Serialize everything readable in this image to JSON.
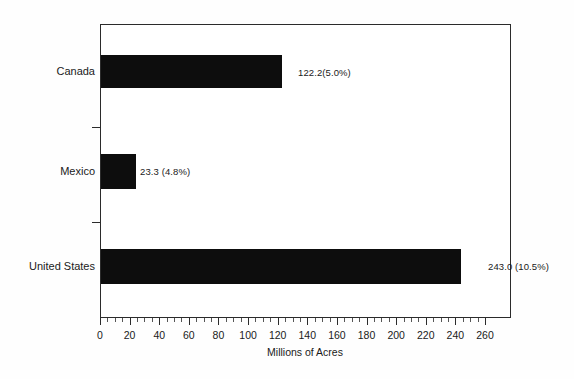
{
  "chart_data": {
    "type": "bar",
    "orientation": "horizontal",
    "title": "",
    "xlabel": "Millions of Acres",
    "ylabel": "",
    "xlim": [
      0,
      260
    ],
    "xticks": [
      0,
      20,
      40,
      60,
      80,
      100,
      120,
      140,
      160,
      180,
      200,
      220,
      240,
      260
    ],
    "xtick_labels": [
      "0",
      "20",
      "40",
      "60",
      "80",
      "100",
      "120",
      "140",
      "160",
      "180",
      "200",
      "220",
      "240",
      "260"
    ],
    "minor_tick_step": 5,
    "grid": false,
    "legend": null,
    "bar_color": "#0d0d0d",
    "axis_color": "#2b2b2b",
    "background": "#ffffff",
    "categories": [
      "Canada",
      "Mexico",
      "United States"
    ],
    "values": [
      122.2,
      23.3,
      243.0
    ],
    "percents": [
      "5.0%",
      "4.8%",
      "10.5%"
    ],
    "data_labels": [
      "122.2(5.0%)",
      "23.3 (4.8%)",
      "243.0 (10.5%)"
    ],
    "points": [
      {
        "category": "Canada",
        "value": 122.2,
        "percent": "5.0%",
        "label": "122.2(5.0%)"
      },
      {
        "category": "Mexico",
        "value": 23.3,
        "percent": "4.8%",
        "label": "23.3 (4.8%)"
      },
      {
        "category": "United States",
        "value": 243.0,
        "percent": "10.5%",
        "label": "243.0 (10.5%)"
      }
    ]
  }
}
